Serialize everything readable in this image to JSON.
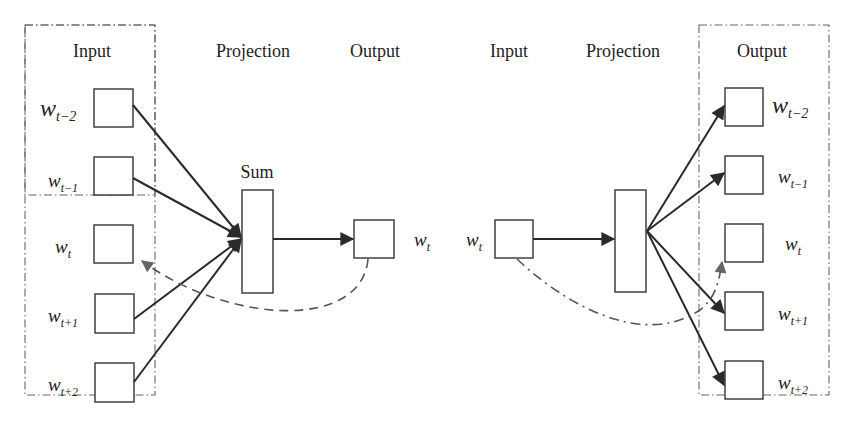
{
  "diagram": {
    "cbow": {
      "headers": {
        "input": "Input",
        "projection": "Projection",
        "output": "Output"
      },
      "sum_label": "Sum",
      "inputs": [
        {
          "base": "w",
          "sub": "t−2"
        },
        {
          "base": "w",
          "sub": "t−1"
        },
        {
          "base": "w",
          "sub": "t"
        },
        {
          "base": "w",
          "sub": "t+1"
        },
        {
          "base": "w",
          "sub": "t+2"
        }
      ],
      "output": {
        "base": "w",
        "sub": "t"
      }
    },
    "skipgram": {
      "headers": {
        "input": "Input",
        "projection": "Projection",
        "output": "Output"
      },
      "input": {
        "base": "w",
        "sub": "t"
      },
      "outputs": [
        {
          "base": "w",
          "sub": "t−2"
        },
        {
          "base": "w",
          "sub": "t−1"
        },
        {
          "base": "w",
          "sub": "t"
        },
        {
          "base": "w",
          "sub": "t+1"
        },
        {
          "base": "w",
          "sub": "t+2"
        }
      ]
    },
    "colors": {
      "stroke": "#333333",
      "arrow": "#2a2a2a",
      "feedback": "#555555",
      "frame": "#666666"
    }
  }
}
